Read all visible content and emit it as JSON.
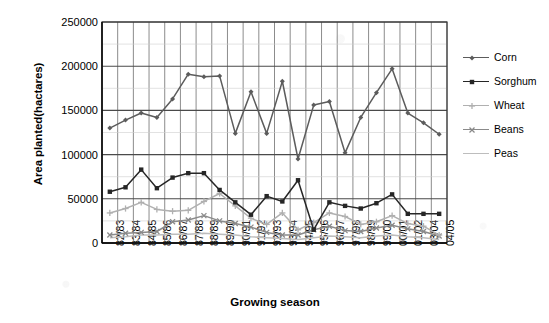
{
  "chart_data": {
    "type": "line",
    "title": "",
    "xlabel": "Growing season",
    "ylabel": "Area planted(hactares)",
    "ylim": [
      0,
      250000
    ],
    "ytick_labels": [
      "0",
      "50000",
      "100000",
      "150000",
      "200000",
      "250000"
    ],
    "ytick_values": [
      0,
      50000,
      100000,
      150000,
      200000,
      250000
    ],
    "grid": "both",
    "legend_position": "right",
    "categories": [
      "82/83",
      "83/84",
      "84/85",
      "85/86",
      "86/87",
      "87/88",
      "88/89",
      "89/90",
      "90/91",
      "91/92",
      "92/93",
      "93/94",
      "94/95",
      "95/96",
      "96/97",
      "97/98",
      "98/99",
      "99/00",
      "00/01",
      "01/02",
      "03/04",
      "04/05"
    ],
    "series": [
      {
        "name": "Corn",
        "color": "#5c5c5c",
        "marker": "diamond",
        "values": [
          130000,
          139000,
          147000,
          142000,
          163000,
          191000,
          188000,
          189000,
          124000,
          171000,
          124000,
          183000,
          95000,
          156000,
          160000,
          102000,
          142000,
          170000,
          197000,
          147000,
          136000,
          123000
        ]
      },
      {
        "name": "Sorghum",
        "color": "#262626",
        "marker": "square",
        "values": [
          58000,
          63000,
          83000,
          62000,
          74000,
          79000,
          79000,
          60000,
          46000,
          32000,
          53000,
          47000,
          71000,
          15000,
          46000,
          42000,
          39000,
          45000,
          55000,
          33000,
          33000,
          33000
        ]
      },
      {
        "name": "Wheat",
        "color": "#b0b0b0",
        "marker": "plus",
        "values": [
          34000,
          39000,
          46000,
          38000,
          36000,
          37000,
          47000,
          56000,
          42000,
          28000,
          21000,
          34000,
          15000,
          23000,
          34000,
          30000,
          21000,
          24000,
          31000,
          22000,
          19000,
          9000
        ]
      },
      {
        "name": "Beans",
        "color": "#8a8a8a",
        "marker": "x",
        "values": [
          9000,
          11000,
          12000,
          13000,
          24000,
          26000,
          31000,
          25000,
          22000,
          18000,
          12000,
          9000,
          9000,
          15000,
          19000,
          14000,
          13000,
          17000,
          20000,
          16000,
          13000,
          8000
        ]
      },
      {
        "name": "Peas",
        "color": "#bdbdbd",
        "marker": "line",
        "values": [
          6000,
          7000,
          9000,
          9000,
          10000,
          10000,
          11000,
          10000,
          9000,
          7000,
          6000,
          5000,
          4000,
          6000,
          8000,
          7000,
          6000,
          8000,
          9000,
          7000,
          6000,
          4000
        ]
      }
    ]
  },
  "legend": {
    "items": [
      {
        "label": "Corn"
      },
      {
        "label": "Sorghum"
      },
      {
        "label": "Wheat"
      },
      {
        "label": "Beans"
      },
      {
        "label": "Peas"
      }
    ]
  }
}
